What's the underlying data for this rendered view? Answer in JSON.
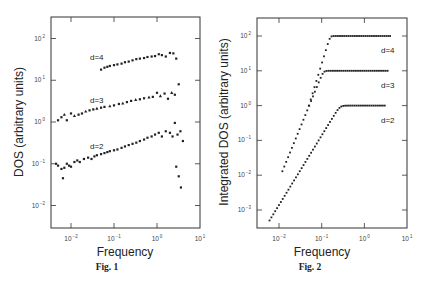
{
  "chart_data": [
    {
      "type": "scatter",
      "title": "",
      "caption": "Fig. 1",
      "xlabel": "Frequency",
      "ylabel": "DOS (arbitrary units)",
      "xscale": "log",
      "yscale": "log",
      "xlim": [
        0.003,
        10
      ],
      "ylim": [
        0.003,
        300
      ],
      "xticks": [
        "10^-2",
        "10^-1",
        "10^0",
        "10^1"
      ],
      "yticks": [
        "10^-2",
        "10^-1",
        "10^0",
        "10^1",
        "10^2"
      ],
      "grid": false,
      "legend": "inline labels",
      "series": [
        {
          "name": "d=4",
          "marker": "square",
          "x": [
            0.05,
            0.06,
            0.07,
            0.08,
            0.1,
            0.12,
            0.15,
            0.18,
            0.22,
            0.27,
            0.33,
            0.4,
            0.5,
            0.6,
            0.75,
            0.9,
            1.1,
            1.3,
            1.6,
            2.0,
            2.4,
            2.8
          ],
          "y": [
            18,
            20,
            21,
            22,
            23,
            24,
            25,
            27,
            28,
            30,
            32,
            33,
            34,
            36,
            37,
            38,
            42,
            40,
            37,
            45,
            44,
            33
          ]
        },
        {
          "name": "d=3",
          "marker": "triangle",
          "x": [
            0.005,
            0.006,
            0.007,
            0.008,
            0.01,
            0.012,
            0.015,
            0.018,
            0.022,
            0.027,
            0.033,
            0.04,
            0.05,
            0.06,
            0.08,
            0.1,
            0.13,
            0.16,
            0.2,
            0.25,
            0.32,
            0.4,
            0.5,
            0.65,
            0.8,
            1.0,
            1.2,
            1.5,
            1.8,
            2.2,
            2.6,
            3.2
          ],
          "y": [
            1.1,
            1.3,
            1.5,
            1.1,
            1.6,
            1.4,
            1.5,
            1.6,
            1.8,
            1.9,
            2.0,
            2.1,
            2.2,
            2.3,
            2.4,
            2.5,
            2.7,
            2.8,
            3.0,
            3.2,
            3.4,
            3.5,
            3.7,
            3.9,
            4.0,
            5.0,
            4.2,
            4.8,
            3.6,
            5.0,
            4.5,
            8.0
          ]
        },
        {
          "name": "d=2",
          "marker": "square",
          "x": [
            0.0045,
            0.005,
            0.006,
            0.0065,
            0.007,
            0.008,
            0.009,
            0.01,
            0.012,
            0.014,
            0.016,
            0.02,
            0.025,
            0.03,
            0.035,
            0.04,
            0.05,
            0.06,
            0.07,
            0.08,
            0.1,
            0.12,
            0.15,
            0.18,
            0.22,
            0.27,
            0.33,
            0.4,
            0.5,
            0.6,
            0.75,
            0.9,
            1.1,
            1.3,
            1.6,
            2.0,
            2.3,
            2.6,
            3.0,
            3.5,
            4.0
          ],
          "y": [
            0.1,
            0.09,
            0.075,
            0.045,
            0.08,
            0.1,
            0.09,
            0.085,
            0.11,
            0.12,
            0.11,
            0.13,
            0.14,
            0.13,
            0.15,
            0.16,
            0.17,
            0.18,
            0.19,
            0.2,
            0.21,
            0.22,
            0.24,
            0.26,
            0.28,
            0.3,
            0.32,
            0.35,
            0.38,
            0.42,
            0.45,
            0.5,
            0.55,
            0.45,
            0.6,
            0.55,
            0.45,
            0.95,
            0.5,
            0.6,
            0.35
          ]
        },
        {
          "name": "tail",
          "marker": "square",
          "x": [
            2.8,
            3.2,
            3.6
          ],
          "y": [
            0.085,
            0.05,
            0.027
          ]
        }
      ]
    },
    {
      "type": "scatter",
      "title": "",
      "caption": "Fig. 2",
      "xlabel": "Frequency",
      "ylabel": "Integrated DOS (arbitrary units)",
      "xscale": "log",
      "yscale": "log",
      "xlim": [
        0.003,
        10
      ],
      "ylim": [
        0.0005,
        300
      ],
      "xticks": [
        "10^-2",
        "10^-1",
        "10^0",
        "10^1"
      ],
      "yticks": [
        "10^-3",
        "10^-2",
        "10^-1",
        "10^0",
        "10^1",
        "10^2"
      ],
      "grid": false,
      "legend": "inline labels",
      "series": [
        {
          "name": "d=4",
          "f_start": 0.05,
          "f_end": 4.0,
          "plateau": 100,
          "slope": 4,
          "y_start": 1.0
        },
        {
          "name": "d=3",
          "f_start": 0.012,
          "f_end": 3.5,
          "plateau": 10,
          "slope": 3,
          "y_start": 0.013
        },
        {
          "name": "d=2",
          "f_start": 0.006,
          "f_end": 3.0,
          "plateau": 1,
          "slope": 2,
          "y_start": 0.0005
        }
      ]
    }
  ],
  "figures": {
    "fig1": {
      "caption": "Fig. 1",
      "xlabel": "Frequency",
      "ylabel": "DOS (arbitrary units)",
      "labels": {
        "d4": "d=4",
        "d3": "d=3",
        "d2": "d=2"
      }
    },
    "fig2": {
      "caption": "Fig. 2",
      "xlabel": "Frequency",
      "ylabel": "Integrated DOS (arbitrary units)",
      "labels": {
        "d4": "d=4",
        "d3": "d=3",
        "d2": "d=2"
      }
    }
  }
}
